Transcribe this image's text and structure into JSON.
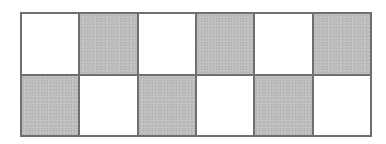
{
  "diagram": {
    "type": "checkerboard-grid",
    "rows": 2,
    "cols": 6,
    "colors": {
      "shaded": "#bdbdbd",
      "unshaded": "#ffffff",
      "border": "#6f6f6f"
    },
    "cells": [
      [
        false,
        true,
        false,
        true,
        false,
        true
      ],
      [
        true,
        false,
        true,
        false,
        true,
        false
      ]
    ],
    "shaded_count": 6,
    "total_count": 12
  }
}
